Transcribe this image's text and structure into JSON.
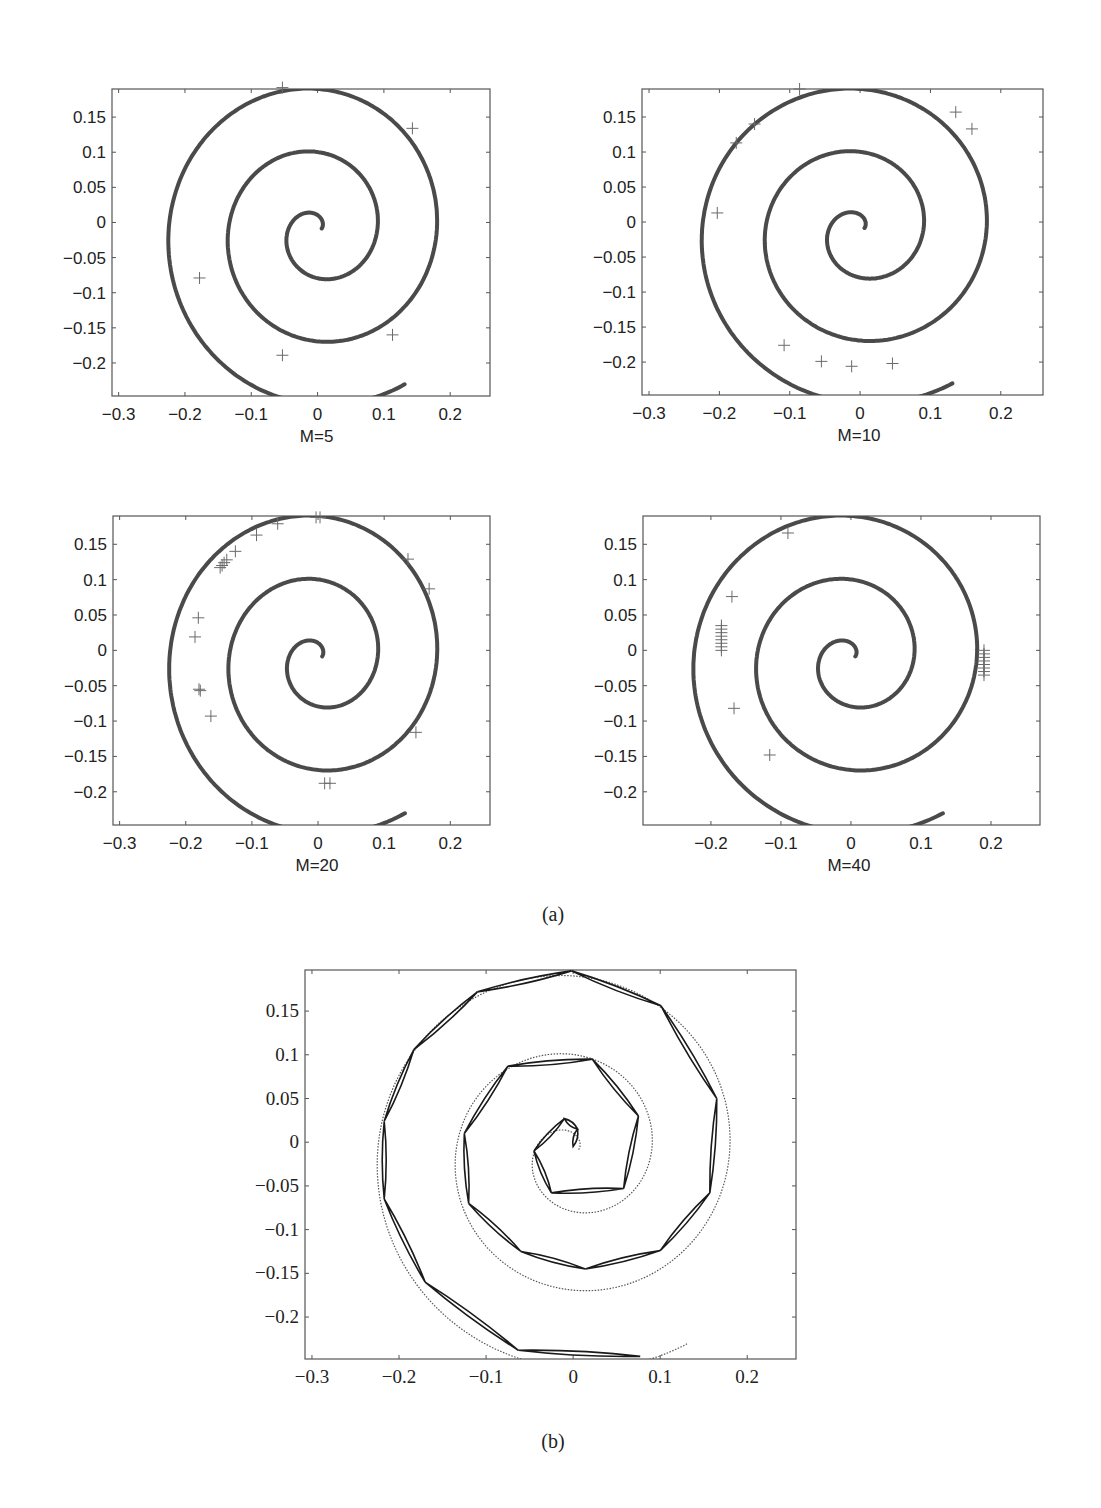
{
  "figure": {
    "caption_a": "(a)",
    "caption_b": "(b)"
  },
  "colors": {
    "spiral": "#4a4a4a",
    "marker": "#6a6a6a",
    "axis": "#555555",
    "polygon": "#1a1a1a"
  },
  "chart_data": [
    {
      "type": "scatter",
      "title": "",
      "xlabel": "M=5",
      "ylabel": "",
      "xlim": [
        -0.31,
        0.26
      ],
      "ylim": [
        -0.247,
        0.19
      ],
      "xticks": [
        "-0.3",
        "-0.2",
        "-0.1",
        "0",
        "0.1",
        "0.2"
      ],
      "yticks": [
        "0.15",
        "0.1",
        "0.05",
        "0",
        "-0.05",
        "-0.1",
        "-0.15",
        "-0.2"
      ],
      "series": [
        {
          "name": "spiral",
          "kind": "line",
          "description": "Archimedean spiral from (0,0.005) outward to (0.065,-0.245)"
        },
        {
          "name": "centers",
          "kind": "plus-markers",
          "points": [
            [
              0.143,
              0.134
            ],
            [
              -0.178,
              -0.079
            ],
            [
              -0.053,
              -0.189
            ],
            [
              0.113,
              -0.16
            ],
            [
              -0.053,
              0.192
            ]
          ]
        }
      ]
    },
    {
      "type": "scatter",
      "title": "",
      "xlabel": "M=10",
      "ylabel": "",
      "xlim": [
        -0.31,
        0.26
      ],
      "ylim": [
        -0.247,
        0.19
      ],
      "xticks": [
        "-0.3",
        "-0.2",
        "-0.1",
        "0",
        "0.1",
        "0.2"
      ],
      "yticks": [
        "0.15",
        "0.1",
        "0.05",
        "0",
        "-0.05",
        "-0.1",
        "-0.15",
        "-0.2"
      ],
      "series": [
        {
          "name": "spiral",
          "kind": "line"
        },
        {
          "name": "centers",
          "kind": "plus-markers",
          "points": [
            [
              -0.086,
              0.19
            ],
            [
              -0.15,
              0.14
            ],
            [
              -0.176,
              0.113
            ],
            [
              0.136,
              0.157
            ],
            [
              0.159,
              0.133
            ],
            [
              -0.203,
              0.013
            ],
            [
              -0.108,
              -0.176
            ],
            [
              -0.055,
              -0.199
            ],
            [
              -0.012,
              -0.206
            ],
            [
              0.046,
              -0.202
            ]
          ]
        }
      ]
    },
    {
      "type": "scatter",
      "title": "",
      "xlabel": "M=20",
      "ylabel": "",
      "xlim": [
        -0.31,
        0.26
      ],
      "ylim": [
        -0.247,
        0.19
      ],
      "xticks": [
        "-0.3",
        "-0.2",
        "-0.1",
        "0",
        "0.1",
        "0.2"
      ],
      "yticks": [
        "0.15",
        "0.1",
        "0.05",
        "0",
        "-0.05",
        "-0.1",
        "-0.15",
        "-0.2"
      ],
      "series": [
        {
          "name": "spiral",
          "kind": "line"
        },
        {
          "name": "centers",
          "kind": "plus-markers",
          "points": [
            [
              -0.003,
              0.188
            ],
            [
              0.003,
              0.188
            ],
            [
              -0.061,
              0.179
            ],
            [
              -0.093,
              0.163
            ],
            [
              -0.125,
              0.14
            ],
            [
              -0.138,
              0.128
            ],
            [
              -0.142,
              0.124
            ],
            [
              -0.145,
              0.12
            ],
            [
              -0.148,
              0.117
            ],
            [
              0.136,
              0.129
            ],
            [
              0.168,
              0.087
            ],
            [
              -0.181,
              0.046
            ],
            [
              -0.186,
              0.019
            ],
            [
              -0.18,
              -0.055
            ],
            [
              -0.178,
              -0.057
            ],
            [
              -0.162,
              -0.093
            ],
            [
              0.148,
              -0.116
            ],
            [
              0.01,
              -0.188
            ],
            [
              0.018,
              -0.188
            ]
          ]
        }
      ]
    },
    {
      "type": "scatter",
      "title": "",
      "xlabel": "M=40",
      "ylabel": "",
      "xlim": [
        -0.297,
        0.27
      ],
      "ylim": [
        -0.247,
        0.19
      ],
      "xticks": [
        "-0.2",
        "-0.1",
        "0",
        "0.1",
        "0.2"
      ],
      "yticks": [
        "0.15",
        "0.1",
        "0.05",
        "0",
        "-0.05",
        "-0.1",
        "-0.15",
        "-0.2"
      ],
      "series": [
        {
          "name": "spiral",
          "kind": "line"
        },
        {
          "name": "centers",
          "kind": "plus-markers",
          "points": [
            [
              -0.09,
              0.166
            ],
            [
              -0.17,
              0.076
            ],
            [
              -0.167,
              -0.082
            ],
            [
              -0.116,
              -0.148
            ],
            [
              -0.185,
              0.035
            ],
            [
              -0.185,
              0.03
            ],
            [
              -0.185,
              0.025
            ],
            [
              -0.185,
              0.02
            ],
            [
              -0.185,
              0.015
            ],
            [
              -0.185,
              0.01
            ],
            [
              -0.185,
              0.005
            ],
            [
              -0.185,
              0.0
            ],
            [
              0.19,
              0.0
            ],
            [
              0.19,
              -0.005
            ],
            [
              0.19,
              -0.01
            ],
            [
              0.19,
              -0.015
            ],
            [
              0.19,
              -0.02
            ],
            [
              0.19,
              -0.025
            ],
            [
              0.19,
              -0.03
            ],
            [
              0.19,
              -0.035
            ]
          ]
        }
      ]
    },
    {
      "type": "line",
      "title": "",
      "xlabel": "",
      "ylabel": "",
      "xlim": [
        -0.308,
        0.256
      ],
      "ylim": [
        -0.248,
        0.197
      ],
      "xticks": [
        "-0.3",
        "-0.2",
        "-0.1",
        "0",
        "0.1",
        "0.2"
      ],
      "yticks": [
        "0.15",
        "0.1",
        "0.05",
        "0",
        "-0.05",
        "-0.1",
        "-0.15",
        "-0.2"
      ],
      "series": [
        {
          "name": "piecewise-linear approximation",
          "kind": "polyline",
          "points": [
            [
              0.077,
              -0.245
            ],
            [
              -0.063,
              -0.238
            ],
            [
              -0.17,
              -0.16
            ],
            [
              -0.217,
              -0.065
            ],
            [
              -0.217,
              0.024
            ],
            [
              -0.183,
              0.106
            ],
            [
              -0.11,
              0.172
            ],
            [
              -0.002,
              0.196
            ],
            [
              0.101,
              0.156
            ],
            [
              0.165,
              0.05
            ],
            [
              0.157,
              -0.058
            ],
            [
              0.1,
              -0.124
            ],
            [
              0.014,
              -0.145
            ],
            [
              -0.06,
              -0.125
            ],
            [
              -0.12,
              -0.07
            ],
            [
              -0.125,
              0.01
            ],
            [
              -0.075,
              0.087
            ],
            [
              0.022,
              0.095
            ],
            [
              0.075,
              0.03
            ],
            [
              0.058,
              -0.053
            ],
            [
              -0.025,
              -0.058
            ],
            [
              -0.045,
              -0.01
            ],
            [
              -0.01,
              0.027
            ],
            [
              0.005,
              0.015
            ],
            [
              0.0,
              -0.005
            ]
          ]
        }
      ]
    }
  ]
}
